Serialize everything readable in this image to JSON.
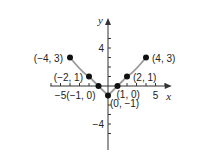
{
  "chart_data": {
    "type": "line",
    "title": "",
    "xlabel": "x",
    "ylabel": "y",
    "xlim": [
      -6.5,
      6.5
    ],
    "ylim": [
      -5.5,
      5.5
    ],
    "x_ticks_labeled": [
      {
        "value": -5,
        "label": "−5"
      },
      {
        "value": 5,
        "label": "5"
      }
    ],
    "y_ticks_labeled": [
      {
        "value": 4,
        "label": "4"
      },
      {
        "value": -4,
        "label": "−4"
      }
    ],
    "grid": false,
    "series": [
      {
        "name": "graph",
        "points": [
          {
            "x": -4,
            "y": 3,
            "label": "(−4, 3)"
          },
          {
            "x": -2,
            "y": 1,
            "label": "(−2, 1)"
          },
          {
            "x": -1,
            "y": 0,
            "label": "(−1, 0)"
          },
          {
            "x": 0,
            "y": -1,
            "label": "(0, −1)"
          },
          {
            "x": 1,
            "y": 0,
            "label": "(1, 0)"
          },
          {
            "x": 2,
            "y": 1,
            "label": "(2, 1)"
          },
          {
            "x": 4,
            "y": 3,
            "label": "(4, 3)"
          }
        ],
        "curve_color": "#9a9a9a",
        "point_color": "#111111"
      }
    ]
  }
}
